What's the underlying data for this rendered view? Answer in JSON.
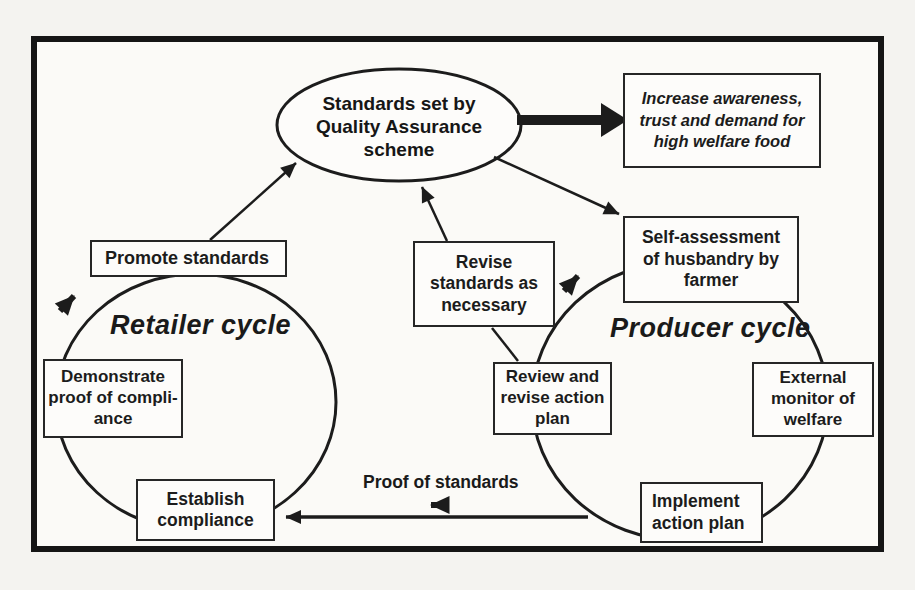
{
  "figure": {
    "type": "flow-diagram",
    "topic": "Quality assurance scheme welfare cycles"
  },
  "colors": {
    "ink": "#1c1c1c",
    "paper": "#f4f3f0",
    "node_background": "#fdfcfa",
    "border": "#151515"
  },
  "ellipse": {
    "label": "Standards set by\nQuality Assurance\nscheme"
  },
  "boxes": {
    "increase_awareness": "Increase awareness,\ntrust and demand for\nhigh welfare food",
    "self_assessment": "Self-assessment\nof husbandry by\nfarmer",
    "promote_standards": "Promote standards",
    "demonstrate_proof": "Demonstrate\nproof of compli-\nance",
    "establish_compliance": "Establish\ncompliance",
    "revise_standards": "Revise\nstandards as\nnecessary",
    "review_revise_plan": "Review and\nrevise action\nplan",
    "external_monitor": "External\nmonitor of\nwelfare",
    "implement_plan": "Implement\naction plan"
  },
  "labels": {
    "retailer_cycle": "Retailer cycle",
    "producer_cycle": "Producer cycle",
    "proof_of_standards": "Proof of standards"
  },
  "icons": {
    "flow_direction": "thick-arrow"
  }
}
